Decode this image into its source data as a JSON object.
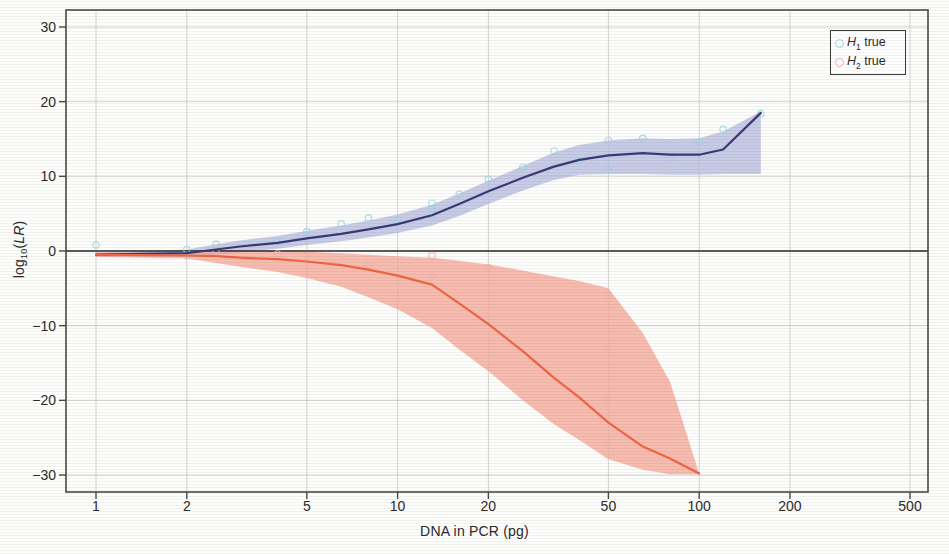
{
  "chart_data": {
    "type": "line",
    "title": "",
    "xlabel": "DNA in PCR (pg)",
    "ylabel": "log10(LR)",
    "ylabel_parts": {
      "base": "log",
      "sub": "10",
      "paren_open": "(",
      "italic": "LR",
      "paren_close": ")"
    },
    "xscale": "log",
    "xlim": [
      1,
      500
    ],
    "ylim": [
      -32,
      32
    ],
    "xticks": [
      1,
      2,
      5,
      10,
      20,
      50,
      100,
      200,
      500
    ],
    "xtick_labels": [
      "1",
      "2",
      "5",
      "10",
      "20",
      "50",
      "100",
      "200",
      "500"
    ],
    "yticks": [
      30,
      20,
      10,
      0,
      -10,
      -20,
      -30
    ],
    "ytick_labels": [
      "30",
      "20",
      "10",
      "0",
      "-10",
      "-20",
      "-30"
    ],
    "grid": true,
    "zero_line": true,
    "legend_position": "top-right",
    "legend": [
      {
        "label_base": "H",
        "label_sub": "1",
        "label_tail": " true",
        "marker_color": "#9fd6e0",
        "line_color": "#3a3a75",
        "band_color": "#b8bce0"
      },
      {
        "label_base": "H",
        "label_sub": "2",
        "label_tail": " true",
        "marker_color": "#f0b3ac",
        "line_color": "#ee6644",
        "band_color": "#f5a99a"
      }
    ],
    "series": [
      {
        "name": "H1 true",
        "line_color": "#3a3a75",
        "band_color": "#b8bce0",
        "x": [
          1,
          2,
          2.5,
          3,
          4,
          5,
          6.5,
          8,
          10,
          13,
          16,
          20,
          26,
          33,
          40,
          50,
          65,
          80,
          100,
          120,
          160
        ],
        "values": [
          -0.5,
          -0.3,
          0.2,
          0.6,
          1.1,
          1.7,
          2.3,
          2.9,
          3.6,
          4.8,
          6.3,
          8.0,
          9.8,
          11.3,
          12.2,
          12.8,
          13.1,
          12.9,
          12.9,
          13.6,
          18.5
        ],
        "band_upper": [
          -0.2,
          0.2,
          0.9,
          1.4,
          2.0,
          2.7,
          3.4,
          4.1,
          4.9,
          6.2,
          7.7,
          9.4,
          11.4,
          13.2,
          14.2,
          14.8,
          15.1,
          15.0,
          15.1,
          16.0,
          18.7
        ],
        "band_lower": [
          -0.8,
          -0.8,
          -0.5,
          -0.2,
          0.3,
          0.8,
          1.3,
          1.8,
          2.4,
          3.4,
          4.7,
          6.3,
          8.1,
          9.5,
          10.2,
          10.3,
          10.3,
          10.2,
          10.2,
          10.3,
          10.3
        ]
      },
      {
        "name": "H2 true",
        "line_color": "#ee6644",
        "band_color": "#f5a99a",
        "x": [
          1,
          2,
          2.5,
          3,
          4,
          5,
          6.5,
          8,
          10,
          13,
          16,
          20,
          26,
          33,
          40,
          50,
          65,
          80,
          100
        ],
        "values": [
          -0.5,
          -0.6,
          -0.7,
          -0.9,
          -1.1,
          -1.4,
          -1.9,
          -2.5,
          -3.3,
          -4.5,
          -7.0,
          -9.8,
          -13.4,
          -17.0,
          -19.6,
          -23.0,
          -26.2,
          -27.8,
          -29.8
        ],
        "band_upper": [
          -0.2,
          -0.2,
          0.1,
          0.1,
          0.0,
          -0.1,
          -0.3,
          -0.5,
          -0.7,
          -0.9,
          -1.3,
          -1.8,
          -2.6,
          -3.4,
          -4.0,
          -5.0,
          -11.0,
          -17.5,
          -29.8
        ],
        "band_lower": [
          -0.8,
          -1.0,
          -1.6,
          -2.1,
          -2.8,
          -3.6,
          -4.8,
          -6.2,
          -7.8,
          -10.3,
          -13.2,
          -16.1,
          -20.0,
          -23.2,
          -25.3,
          -27.9,
          -29.3,
          -29.9,
          -29.9
        ]
      }
    ],
    "scatter": [
      {
        "name": "H1 points",
        "color": "#9fd6e0",
        "x": [
          1,
          2,
          2,
          2.5,
          4,
          5,
          5,
          6.5,
          8,
          10,
          13,
          13,
          13,
          16,
          20,
          26,
          33,
          40,
          50,
          50,
          65,
          80,
          100,
          120,
          160
        ],
        "y": [
          0.8,
          0.2,
          -0.6,
          0.9,
          1.3,
          2.6,
          1.9,
          3.6,
          4.4,
          4.2,
          6.4,
          5.6,
          4.8,
          7.6,
          9.6,
          11.2,
          13.4,
          12.0,
          14.8,
          11.0,
          15.1,
          12.4,
          14.6,
          16.3,
          18.4
        ]
      },
      {
        "name": "H2 points",
        "color": "#f0b3ac",
        "x": [
          2.5,
          4,
          5,
          8,
          13,
          13,
          20,
          50,
          50,
          50,
          50
        ],
        "y": [
          0.1,
          -0.4,
          -0.6,
          -1.8,
          -0.6,
          -3.4,
          -2.2,
          -6.0,
          -13.0,
          -20.0,
          -26.0
        ]
      }
    ]
  }
}
